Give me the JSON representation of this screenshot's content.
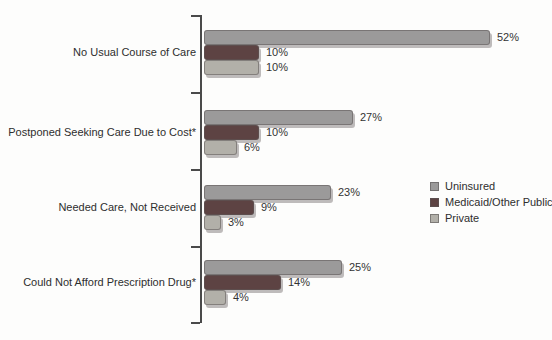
{
  "chart_data": {
    "type": "bar",
    "orientation": "horizontal",
    "title": "",
    "xlabel": "",
    "ylabel": "",
    "grid": false,
    "legend_position": "right",
    "xlim": [
      0,
      55
    ],
    "categories": [
      "No Usual Course of Care",
      "Postponed Seeking Care Due to Cost*",
      "Needed Care, Not Received",
      "Could Not Afford Prescription Drug*"
    ],
    "series": [
      {
        "name": "Uninsured",
        "color": "#9b9a9a",
        "values": [
          52,
          27,
          23,
          25
        ],
        "labels": [
          "52%",
          "27%",
          "23%",
          "25%"
        ]
      },
      {
        "name": "Medicaid/Other Public",
        "color": "#5d4343",
        "values": [
          10,
          10,
          9,
          14
        ],
        "labels": [
          "10%",
          "10%",
          "9%",
          "14%"
        ]
      },
      {
        "name": "Private",
        "color": "#b2b0a9",
        "values": [
          10,
          6,
          3,
          4
        ],
        "labels": [
          "10%",
          "6%",
          "3%",
          "4%"
        ]
      }
    ]
  },
  "colors": {
    "axis": "#4a4a4a",
    "text": "#333333",
    "background": "#fdfdfc"
  }
}
